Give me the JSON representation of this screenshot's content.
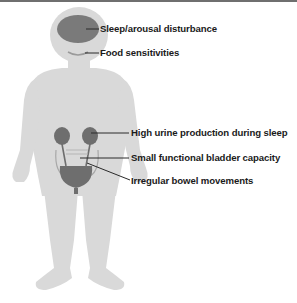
{
  "diagram": {
    "colors": {
      "body": "#d9d9d9",
      "organ": "#6e6e6e",
      "organ_outline": "#a8a8a8",
      "leader_line": "#2a2a2a",
      "label_text": "#1a1a1a",
      "top_rule": "#6f6f6f"
    },
    "labels": [
      {
        "id": "sleep",
        "text": "Sleep/arousal disturbance",
        "target": "brain"
      },
      {
        "id": "food",
        "text": "Food sensitivities",
        "target": "mouth"
      },
      {
        "id": "urine",
        "text": "High urine production during sleep",
        "target": "kidneys"
      },
      {
        "id": "bladder",
        "text": "Small functional bladder capacity",
        "target": "bladder"
      },
      {
        "id": "bowel",
        "text": "Irregular bowel movements",
        "target": "bowel"
      }
    ]
  }
}
